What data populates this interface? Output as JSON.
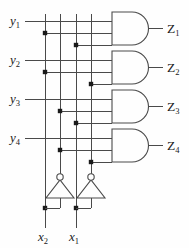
{
  "figure": {
    "background_color": "#fefefe",
    "wire_color": "#3a3a3a",
    "gate_color": "#4a4a4a",
    "text_color": "#1a1a1a"
  },
  "inputs_left": [
    {
      "name": "y1",
      "label": "y",
      "sub": "1",
      "y": 26
    },
    {
      "name": "y2",
      "label": "y",
      "sub": "2",
      "y": 65
    },
    {
      "name": "y3",
      "label": "y",
      "sub": "3",
      "y": 104
    },
    {
      "name": "y4",
      "label": "y",
      "sub": "4",
      "y": 143
    }
  ],
  "inputs_bottom": [
    {
      "name": "x2",
      "label": "x",
      "sub": "2",
      "x": 45
    },
    {
      "name": "x1",
      "label": "x",
      "sub": "1",
      "x": 76
    }
  ],
  "outputs": [
    {
      "name": "Z1",
      "label": "Z",
      "sub": "1",
      "y": 33
    },
    {
      "name": "Z2",
      "label": "Z",
      "sub": "2",
      "y": 72
    },
    {
      "name": "Z3",
      "label": "Z",
      "sub": "3",
      "y": 111
    },
    {
      "name": "Z4",
      "label": "Z",
      "sub": "4",
      "y": 150
    }
  ],
  "vertical_rails": [
    {
      "name": "rail-x2",
      "x": 45,
      "signal": "x2"
    },
    {
      "name": "rail-x2-bar",
      "x": 60,
      "signal": "x2-bar"
    },
    {
      "name": "rail-x1",
      "x": 76,
      "signal": "x1"
    },
    {
      "name": "rail-x1-bar",
      "x": 91,
      "signal": "x1-bar"
    }
  ],
  "inverters": [
    {
      "name": "inverter-x2",
      "x": 60,
      "bubble_y": 176,
      "input_x": 45
    },
    {
      "name": "inverter-x1",
      "x": 91,
      "bubble_y": 176,
      "input_x": 76
    }
  ],
  "gates": [
    {
      "name": "and-gate-1",
      "type": "AND",
      "output": "Z1",
      "inputs": [
        "y1",
        "x2",
        "x1"
      ],
      "taps": [
        {
          "x": 45,
          "y": 33
        },
        {
          "x": 76,
          "y": 45
        }
      ]
    },
    {
      "name": "and-gate-2",
      "type": "AND",
      "output": "Z2",
      "inputs": [
        "y2",
        "x2",
        "x1-bar"
      ],
      "taps": [
        {
          "x": 45,
          "y": 72
        },
        {
          "x": 91,
          "y": 84
        }
      ]
    },
    {
      "name": "and-gate-3",
      "type": "AND",
      "output": "Z3",
      "inputs": [
        "y3",
        "x2-bar",
        "x1"
      ],
      "taps": [
        {
          "x": 60,
          "y": 111
        },
        {
          "x": 76,
          "y": 123
        }
      ]
    },
    {
      "name": "and-gate-4",
      "type": "AND",
      "output": "Z4",
      "inputs": [
        "y4",
        "x2-bar",
        "x1-bar"
      ],
      "taps": [
        {
          "x": 60,
          "y": 150
        },
        {
          "x": 91,
          "y": 162
        }
      ]
    }
  ],
  "junction_dots_bottom": [
    {
      "name": "dot-x2-branch",
      "x": 45,
      "y": 208
    },
    {
      "name": "dot-x1-branch",
      "x": 76,
      "y": 208
    }
  ]
}
